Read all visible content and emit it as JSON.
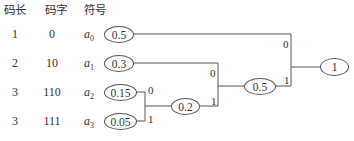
{
  "table": {
    "headers": [
      "码长",
      "码字",
      "符号"
    ],
    "rows": [
      {
        "length": "1",
        "code": "0",
        "symbol": "a",
        "sub": "0",
        "prob": "0.5"
      },
      {
        "length": "2",
        "code": "10",
        "symbol": "a",
        "sub": "1",
        "prob": "0.3"
      },
      {
        "length": "3",
        "code": "110",
        "symbol": "a",
        "sub": "2",
        "prob": "0.15"
      },
      {
        "length": "3",
        "code": "111",
        "symbol": "a",
        "sub": "3",
        "prob": "0.05"
      }
    ]
  },
  "tree": {
    "internal_nodes": [
      {
        "id": "n02",
        "value": "0.2"
      },
      {
        "id": "n05",
        "value": "0.5"
      },
      {
        "id": "root",
        "value": "1"
      }
    ],
    "edge_labels": {
      "a2_to_n02": "0",
      "a3_to_n02": "1",
      "a1_to_n05": "0",
      "n02_to_n05": "1",
      "a0_to_root": "0",
      "n05_to_root": "1"
    }
  },
  "colors": {
    "line": "#555555",
    "text": "#333333",
    "background": "#ffffff"
  }
}
